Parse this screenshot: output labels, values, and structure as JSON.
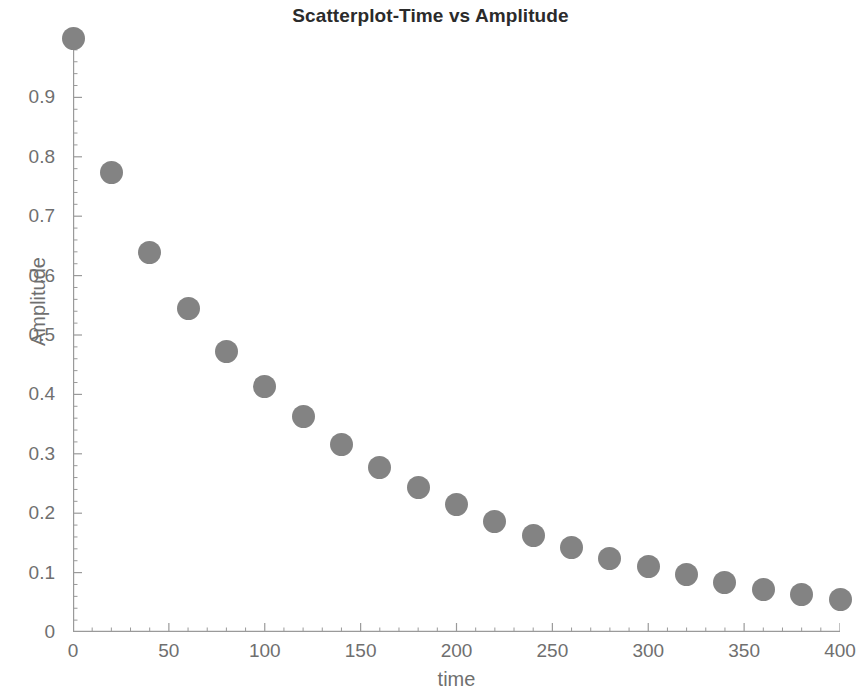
{
  "chart_data": {
    "type": "scatter",
    "title": "Scatterplot-Time vs Amplitude",
    "xlabel": "time",
    "ylabel": "Amplitude",
    "xlim": [
      0,
      400
    ],
    "ylim": [
      0,
      1.0
    ],
    "xticks": [
      0,
      50,
      100,
      150,
      200,
      250,
      300,
      350,
      400
    ],
    "xtick_labels": [
      "0",
      "50",
      "100",
      "150",
      "200",
      "250",
      "300",
      "350",
      "400"
    ],
    "yticks": [
      0,
      0.1,
      0.2,
      0.3,
      0.4,
      0.5,
      0.6,
      0.7,
      0.8,
      0.9
    ],
    "ytick_labels": [
      "0",
      "0.1",
      "0.2",
      "0.3",
      "0.4",
      "0.5",
      "0.6",
      "0.7",
      "0.8",
      "0.9"
    ],
    "grid": false,
    "legend": null,
    "marker": "circle",
    "marker_color": "#838383",
    "marker_size_px": 23,
    "axis_color": "#9a9a9a",
    "text_color": "#6f6f6f",
    "title_color": "#2b2b2b",
    "background": "#ffffff",
    "x": [
      0,
      20,
      40,
      60,
      80,
      100,
      120,
      140,
      160,
      180,
      200,
      220,
      240,
      260,
      280,
      300,
      320,
      340,
      360,
      380,
      400
    ],
    "y": [
      1.0,
      0.773,
      0.639,
      0.545,
      0.473,
      0.414,
      0.362,
      0.315,
      0.277,
      0.243,
      0.214,
      0.186,
      0.162,
      0.142,
      0.124,
      0.11,
      0.097,
      0.084,
      0.072,
      0.063,
      0.055
    ]
  }
}
